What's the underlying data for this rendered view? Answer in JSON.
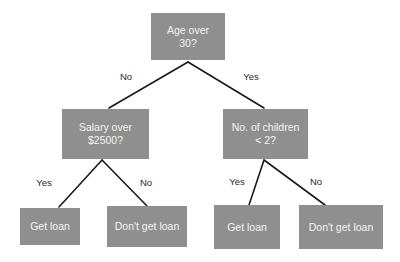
{
  "diagram": {
    "type": "decision-tree",
    "colors": {
      "node_fill": "#8f8f8f",
      "node_text": "#f4f4f4",
      "edge": "#1a1a1a",
      "label_text": "#2a2a2a",
      "background": "#ffffff"
    },
    "nodes": {
      "root": {
        "label": "Age over\n30?"
      },
      "salary": {
        "label": "Salary over\n$2500?"
      },
      "children": {
        "label": "No. of children\n< 2?"
      },
      "leaf1": {
        "label": "Get loan"
      },
      "leaf2": {
        "label": "Don't get loan"
      },
      "leaf3": {
        "label": "Get loan"
      },
      "leaf4": {
        "label": "Don't get loan"
      }
    },
    "edges": {
      "root_to_salary": {
        "label": "No"
      },
      "root_to_children": {
        "label": "Yes"
      },
      "salary_to_leaf1": {
        "label": "Yes"
      },
      "salary_to_leaf2": {
        "label": "No"
      },
      "children_to_leaf3": {
        "label": "Yes"
      },
      "children_to_leaf4": {
        "label": "No"
      }
    }
  }
}
